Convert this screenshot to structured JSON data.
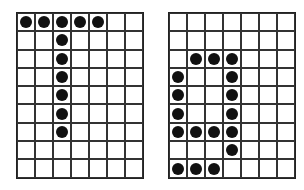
{
  "grids": [
    {
      "name": "left-dot-grid",
      "cols": 7,
      "rows": 9,
      "filled": [
        [
          0,
          0
        ],
        [
          0,
          1
        ],
        [
          0,
          2
        ],
        [
          0,
          3
        ],
        [
          0,
          4
        ],
        [
          1,
          2
        ],
        [
          2,
          2
        ],
        [
          3,
          2
        ],
        [
          4,
          2
        ],
        [
          5,
          2
        ],
        [
          6,
          2
        ]
      ]
    },
    {
      "name": "right-dot-grid",
      "cols": 7,
      "rows": 9,
      "filled": [
        [
          2,
          1
        ],
        [
          2,
          2
        ],
        [
          2,
          3
        ],
        [
          3,
          0
        ],
        [
          3,
          3
        ],
        [
          4,
          0
        ],
        [
          4,
          3
        ],
        [
          5,
          0
        ],
        [
          5,
          3
        ],
        [
          6,
          0
        ],
        [
          6,
          1
        ],
        [
          6,
          2
        ],
        [
          6,
          3
        ],
        [
          7,
          3
        ],
        [
          8,
          0
        ],
        [
          8,
          1
        ],
        [
          8,
          2
        ]
      ]
    }
  ],
  "colors": {
    "dot": "#111111",
    "line": "#333333",
    "background": "#ffffff"
  }
}
